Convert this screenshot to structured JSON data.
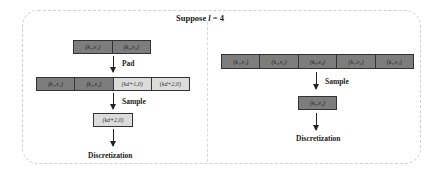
{
  "title": {
    "prefix": "Suppose ",
    "variable": "l",
    "suffix": " = 4"
  },
  "left_panel": {
    "input_row": [
      {
        "text": "(k₁,v₁)",
        "shade": "dark"
      },
      {
        "text": "(k₂,v₂)",
        "shade": "dark"
      }
    ],
    "pad_label": "Pad",
    "padded_row": [
      {
        "text": "(k₁,v₁)",
        "shade": "dark"
      },
      {
        "text": "(k₂,v₂)",
        "shade": "dark"
      },
      {
        "text": "(k_{d+1},0)",
        "display": "(kd+1,0)",
        "shade": "light"
      },
      {
        "text": "(k_{d+2},0)",
        "display": "(kd+2,0)",
        "shade": "light"
      }
    ],
    "sample_label": "Sample",
    "sampled": {
      "text": "(k_{d+2},0)",
      "display": "(kd+2,0)",
      "shade": "light"
    },
    "output_label": "Discretization"
  },
  "right_panel": {
    "input_row": [
      {
        "text": "(k₁,v₁)",
        "shade": "dark"
      },
      {
        "text": "(k₂,v₂)",
        "shade": "dark"
      },
      {
        "text": "(k₃,v₃)",
        "shade": "dark"
      },
      {
        "text": "(k₄,v₄)",
        "shade": "dark"
      },
      {
        "text": "(k₅,v₅)",
        "shade": "dark"
      }
    ],
    "sample_label": "Sample",
    "sampled": {
      "text": "(k₂,v₂)",
      "shade": "dark"
    },
    "output_label": "Discretization"
  },
  "colors": {
    "dark_cell": "#7d7d7d",
    "light_cell": "#dcdcdc",
    "border": "#333333",
    "frame": "#cfcfcf"
  }
}
